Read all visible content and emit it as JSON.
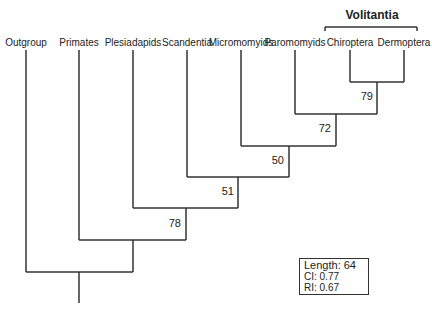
{
  "diagram": {
    "type": "phylogenetic-tree",
    "taxa": [
      {
        "name": "Outgroup",
        "x": 26
      },
      {
        "name": "Primates",
        "x": 79
      },
      {
        "name": "Plesiadapids",
        "x": 133
      },
      {
        "name": "Scandentia",
        "x": 187
      },
      {
        "name": "Micromomyids",
        "x": 241
      },
      {
        "name": "Paromomyids",
        "x": 295
      },
      {
        "name": "Chiroptera",
        "x": 350
      },
      {
        "name": "Dermoptera",
        "x": 404
      }
    ],
    "clade_label": "Volitantia",
    "support_values": [
      {
        "node": "Chiroptera+Dermoptera",
        "value": "79"
      },
      {
        "node": "Paromomyids+Volitantia",
        "value": "72"
      },
      {
        "node": "Micromomyids+clade",
        "value": "50"
      },
      {
        "node": "Scandentia+clade",
        "value": "51"
      },
      {
        "node": "Plesiadapids+clade",
        "value": "78"
      }
    ],
    "stats": {
      "length": "Length: 64",
      "ci": "CI: 0.77",
      "ri": "RI: 0.67"
    }
  }
}
